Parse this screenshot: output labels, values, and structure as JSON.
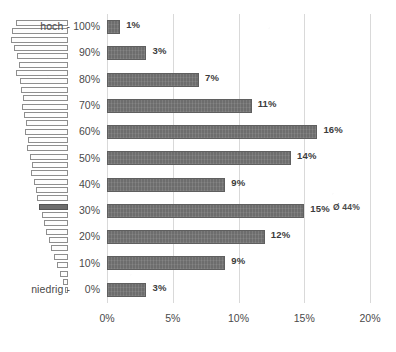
{
  "chart_data": {
    "type": "bar",
    "title": "",
    "subtitle": "",
    "xlabel": "",
    "ylabel": "",
    "orientation": "horizontal",
    "categories": [
      "100%",
      "90%",
      "80%",
      "70%",
      "60%",
      "50%",
      "40%",
      "30%",
      "20%",
      "10%",
      "0%"
    ],
    "values": [
      1,
      3,
      7,
      11,
      16,
      14,
      9,
      15,
      12,
      9,
      3
    ],
    "data_labels": [
      "1%",
      "3%",
      "7%",
      "11%",
      "16%",
      "14%",
      "9%",
      "15%",
      "12%",
      "9%",
      "3%"
    ],
    "xlim": [
      0,
      20
    ],
    "xticks": [
      0,
      5,
      10,
      15,
      20
    ],
    "xticklabels": [
      "0%",
      "5%",
      "10%",
      "15%",
      "20%"
    ],
    "grid": "vertical",
    "legend": "none",
    "bar_color": "#6d6d6d",
    "gridline_color": "#d9d9d9",
    "annotations": {
      "axis_top": "hoch -",
      "axis_bottom": "niedrig -",
      "average": "Ø 44%",
      "average_category": "40%"
    },
    "sidebar_distribution": {
      "description": "right-aligned tapering bar pyramid, one filled bar marks the average",
      "widths": [
        52,
        56,
        57,
        54,
        51,
        49,
        52,
        48,
        47,
        45,
        46,
        44,
        42,
        43,
        40,
        41,
        38,
        36,
        37,
        34,
        32,
        31,
        29,
        26,
        24,
        22,
        19,
        17,
        14,
        11,
        8,
        5,
        3
      ],
      "filled_index": 22
    }
  },
  "yaxis": {
    "ticks": [
      "100%",
      "90%",
      "80%",
      "70%",
      "60%",
      "50%",
      "40%",
      "30%",
      "20%",
      "10%",
      "0%"
    ],
    "top_label": "hoch -",
    "bottom_label": "niedrig -"
  },
  "xaxis": {
    "ticks": [
      "0%",
      "5%",
      "10%",
      "15%",
      "20%"
    ]
  },
  "average_marker": {
    "label": "Ø 44%"
  }
}
